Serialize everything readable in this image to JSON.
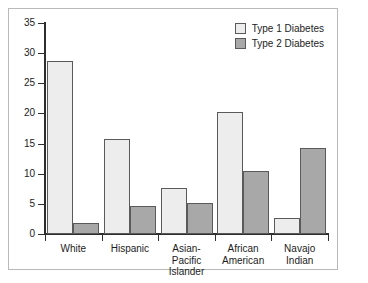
{
  "chart_data": {
    "type": "bar",
    "title": "",
    "subtitle": "",
    "xlabel": "",
    "ylabel": "",
    "categories": [
      "White",
      "Hispanic",
      "Asian-Pacific Islander",
      "African American",
      "Navajo Indian"
    ],
    "category_lines": [
      [
        "White"
      ],
      [
        "Hispanic"
      ],
      [
        "Asian-Pacific",
        "Islander"
      ],
      [
        "African",
        "American"
      ],
      [
        "Navajo",
        "Indian"
      ]
    ],
    "series": [
      {
        "name": "Type 1 Diabetes",
        "color": "#ededed",
        "values": [
          28.7,
          15.8,
          7.6,
          20.2,
          2.7
        ]
      },
      {
        "name": "Type 2 Diabetes",
        "color": "#a8a8a8",
        "values": [
          1.9,
          4.6,
          5.1,
          10.4,
          14.2
        ]
      }
    ],
    "ylim": [
      0,
      35
    ],
    "yticks": [
      0,
      5,
      10,
      15,
      20,
      25,
      30,
      35
    ],
    "ytick_labels": [
      "0",
      "5",
      "10",
      "15",
      "20",
      "25",
      "30",
      "35"
    ],
    "grid": false,
    "legend_position": "top-right",
    "bar_border_color": "#5a5a5a",
    "axis_color": "#2e2e2e",
    "frame_color": "#b9b9b9",
    "background": "#ffffff"
  },
  "legend": {
    "entries": [
      {
        "label": "Type 1 Diabetes",
        "color": "#ededed"
      },
      {
        "label": "Type 2 Diabetes",
        "color": "#a8a8a8"
      }
    ]
  }
}
